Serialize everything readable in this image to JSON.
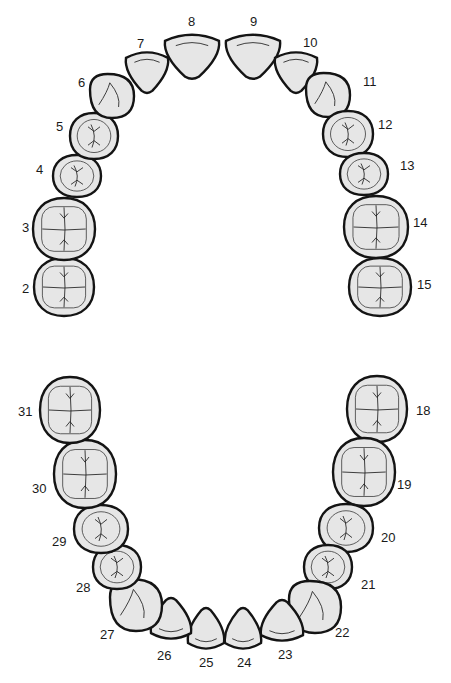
{
  "diagram": {
    "title": "",
    "colors": {
      "tooth_fill": "#e6e6e6",
      "outline": "#141414",
      "background": "#ffffff"
    },
    "upper_arch": {
      "teeth": [
        {
          "number": "2",
          "type": "molar",
          "cx": 64,
          "cy": 287,
          "rx": 30,
          "ry": 29,
          "label_x": 22,
          "label_y": 293
        },
        {
          "number": "3",
          "type": "molar",
          "cx": 64,
          "cy": 229,
          "rx": 31,
          "ry": 31,
          "label_x": 22,
          "label_y": 232
        },
        {
          "number": "4",
          "type": "premolar",
          "cx": 77,
          "cy": 176,
          "rx": 24,
          "ry": 21,
          "label_x": 36,
          "label_y": 174
        },
        {
          "number": "5",
          "type": "premolar",
          "cx": 94,
          "cy": 136,
          "rx": 24,
          "ry": 23,
          "label_x": 56,
          "label_y": 131
        },
        {
          "number": "6",
          "type": "canine",
          "cx": 112,
          "cy": 96,
          "rx": 22,
          "ry": 22,
          "label_x": 78,
          "label_y": 87
        },
        {
          "number": "7",
          "type": "lateral-incisor",
          "cx": 147,
          "cy": 70,
          "rx": 21,
          "ry": 22,
          "label_x": 137,
          "label_y": 48
        },
        {
          "number": "8",
          "type": "central-incisor",
          "cx": 192,
          "cy": 54,
          "rx": 27,
          "ry": 24,
          "label_x": 188,
          "label_y": 26
        },
        {
          "number": "9",
          "type": "central-incisor",
          "cx": 253,
          "cy": 54,
          "rx": 27,
          "ry": 24,
          "label_x": 250,
          "label_y": 26
        },
        {
          "number": "10",
          "type": "lateral-incisor",
          "cx": 296,
          "cy": 70,
          "rx": 21,
          "ry": 22,
          "label_x": 303,
          "label_y": 47
        },
        {
          "number": "11",
          "type": "canine",
          "cx": 328,
          "cy": 95,
          "rx": 22,
          "ry": 22,
          "label_x": 363,
          "label_y": 86
        },
        {
          "number": "12",
          "type": "premolar",
          "cx": 348,
          "cy": 134,
          "rx": 25,
          "ry": 23,
          "label_x": 378,
          "label_y": 129
        },
        {
          "number": "13",
          "type": "premolar",
          "cx": 364,
          "cy": 174,
          "rx": 24,
          "ry": 21,
          "label_x": 400,
          "label_y": 170
        },
        {
          "number": "14",
          "type": "molar",
          "cx": 376,
          "cy": 227,
          "rx": 32,
          "ry": 31,
          "label_x": 413,
          "label_y": 227
        },
        {
          "number": "15",
          "type": "molar",
          "cx": 380,
          "cy": 287,
          "rx": 31,
          "ry": 29,
          "label_x": 417,
          "label_y": 289
        }
      ]
    },
    "lower_arch": {
      "teeth": [
        {
          "number": "18",
          "type": "molar",
          "cx": 377,
          "cy": 409,
          "rx": 30,
          "ry": 33,
          "label_x": 416,
          "label_y": 415
        },
        {
          "number": "19",
          "type": "molar",
          "cx": 364,
          "cy": 472,
          "rx": 31,
          "ry": 34,
          "label_x": 397,
          "label_y": 489
        },
        {
          "number": "20",
          "type": "premolar",
          "cx": 346,
          "cy": 528,
          "rx": 27,
          "ry": 24,
          "label_x": 381,
          "label_y": 542
        },
        {
          "number": "21",
          "type": "premolar",
          "cx": 328,
          "cy": 567,
          "rx": 24,
          "ry": 22,
          "label_x": 361,
          "label_y": 589
        },
        {
          "number": "22",
          "type": "canine",
          "cx": 315,
          "cy": 607,
          "rx": 26,
          "ry": 26,
          "label_x": 335,
          "label_y": 637
        },
        {
          "number": "23",
          "type": "lateral-incisor",
          "cx": 282,
          "cy": 623,
          "rx": 21,
          "ry": 22,
          "label_x": 278,
          "label_y": 659
        },
        {
          "number": "24",
          "type": "central-incisor",
          "cx": 243,
          "cy": 631,
          "rx": 18,
          "ry": 22,
          "label_x": 237,
          "label_y": 667
        },
        {
          "number": "25",
          "type": "central-incisor",
          "cx": 206,
          "cy": 631,
          "rx": 18,
          "ry": 22,
          "label_x": 199,
          "label_y": 667
        },
        {
          "number": "26",
          "type": "lateral-incisor",
          "cx": 171,
          "cy": 621,
          "rx": 20,
          "ry": 22,
          "label_x": 157,
          "label_y": 660
        },
        {
          "number": "27",
          "type": "canine",
          "cx": 136,
          "cy": 605,
          "rx": 26,
          "ry": 26,
          "label_x": 100,
          "label_y": 639
        },
        {
          "number": "28",
          "type": "premolar",
          "cx": 117,
          "cy": 567,
          "rx": 24,
          "ry": 22,
          "label_x": 76,
          "label_y": 592
        },
        {
          "number": "29",
          "type": "premolar",
          "cx": 101,
          "cy": 529,
          "rx": 27,
          "ry": 24,
          "label_x": 52,
          "label_y": 546
        },
        {
          "number": "30",
          "type": "molar",
          "cx": 85,
          "cy": 474,
          "rx": 31,
          "ry": 34,
          "label_x": 32,
          "label_y": 493
        },
        {
          "number": "31",
          "type": "molar",
          "cx": 70,
          "cy": 410,
          "rx": 30,
          "ry": 33,
          "label_x": 18,
          "label_y": 416
        }
      ]
    }
  }
}
